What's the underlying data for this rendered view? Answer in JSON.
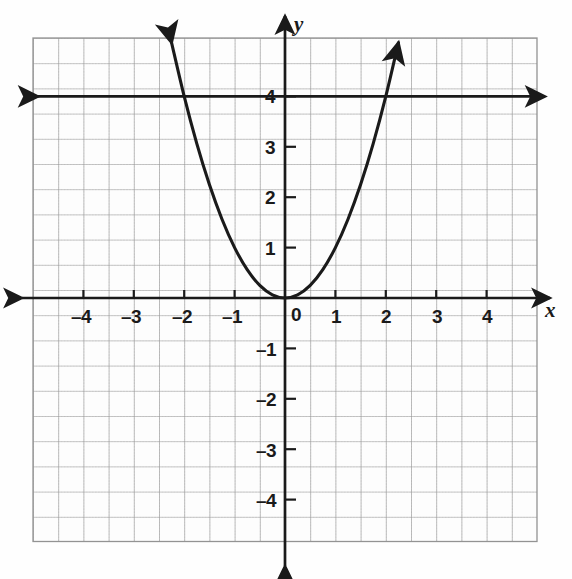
{
  "figure": {
    "kind": "coordinate-plane-graph",
    "axis_labels": {
      "x": "x",
      "y": "y"
    },
    "origin_label": "0",
    "x_tick_labels": [
      "–4",
      "–3",
      "–2",
      "–1",
      "1",
      "2",
      "3",
      "4"
    ],
    "y_tick_labels": [
      "4",
      "3",
      "2",
      "1",
      "–1",
      "–2",
      "–3",
      "–4"
    ],
    "colors": {
      "curve": "#1a1a1a",
      "axis": "#1a1a1a",
      "major_grid": "#8d8d8d",
      "minor_grid": "#c8c8c8",
      "background": "#fefefe",
      "label_text": "#1a1a1a"
    }
  },
  "chart_data": {
    "type": "line",
    "title": "",
    "xlabel": "x",
    "ylabel": "y",
    "xlim": [
      -5,
      5
    ],
    "ylim": [
      -5,
      5
    ],
    "xticks": [
      -4,
      -3,
      -2,
      -1,
      0,
      1,
      2,
      3,
      4
    ],
    "yticks": [
      -4,
      -3,
      -2,
      -1,
      0,
      1,
      2,
      3,
      4
    ],
    "grid": true,
    "minor_grid": true,
    "legend": "none",
    "series": [
      {
        "name": "parabola",
        "equation": "y = x^2",
        "type": "line",
        "arrows": "both",
        "x": [
          -2.25,
          -2.0,
          -1.75,
          -1.5,
          -1.25,
          -1.0,
          -0.75,
          -0.5,
          -0.25,
          0,
          0.25,
          0.5,
          0.75,
          1.0,
          1.25,
          1.5,
          1.75,
          2.0,
          2.25
        ],
        "values": [
          5.0625,
          4,
          3.0625,
          2.25,
          1.5625,
          1,
          0.5625,
          0.25,
          0.0625,
          0,
          0.0625,
          0.25,
          0.5625,
          1,
          1.5625,
          2.25,
          3.0625,
          4,
          5.0625
        ],
        "vertex": [
          0,
          0
        ]
      },
      {
        "name": "horizontal-line",
        "equation": "y = 4",
        "type": "line",
        "arrows": "both",
        "x": [
          -5,
          5
        ],
        "values": [
          4,
          4
        ]
      }
    ],
    "intersections": [
      [
        -2,
        4
      ],
      [
        2,
        4
      ]
    ]
  }
}
